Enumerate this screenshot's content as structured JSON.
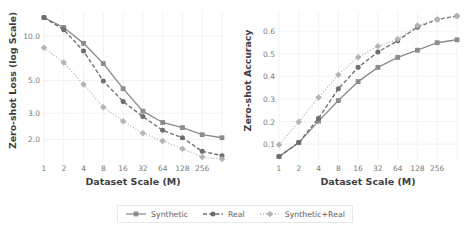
{
  "figure": {
    "xlabel": "Dataset Scale (M)",
    "legend": {
      "items": [
        {
          "label": "Synthetic",
          "color": "#8c8c8c",
          "dash": "solid",
          "marker": "square"
        },
        {
          "label": "Real",
          "color": "#6e6e6e",
          "dash": "dashed",
          "marker": "circle"
        },
        {
          "label": "Synthetic+Real",
          "color": "#b4b4b4",
          "dash": "dotted",
          "marker": "diamond"
        }
      ]
    }
  },
  "chart_data": [
    {
      "type": "line",
      "id": "zero-shot-loss",
      "title": "",
      "xlabel": "Dataset Scale (M)",
      "ylabel": "Zero-shot Loss (log Scale)",
      "yscale": "log",
      "xscale": "log",
      "grid": true,
      "legend_position": "below-figure",
      "x": [
        1,
        2,
        4,
        8,
        16,
        32,
        64,
        128,
        256,
        512
      ],
      "xtick_labels": [
        "1",
        "2",
        "4",
        "8",
        "16",
        "32",
        "64",
        "128",
        "256"
      ],
      "ytick_labels": [
        "10.0",
        "5.0",
        "3.0",
        "2.0"
      ],
      "ytick_values": [
        10.0,
        5.0,
        3.0,
        2.0
      ],
      "ylim": [
        1.45,
        14.5
      ],
      "series": [
        {
          "name": "Synthetic",
          "values": [
            13.3,
            11.4,
            8.9,
            6.5,
            4.4,
            3.1,
            2.6,
            2.4,
            2.15,
            2.05
          ]
        },
        {
          "name": "Real",
          "values": [
            13.3,
            11.0,
            7.9,
            4.95,
            3.6,
            2.85,
            2.3,
            2.05,
            1.66,
            1.55
          ]
        },
        {
          "name": "Synthetic+Real",
          "values": [
            8.3,
            6.6,
            4.7,
            3.3,
            2.65,
            2.2,
            1.95,
            1.73,
            1.52,
            1.47
          ]
        }
      ]
    },
    {
      "type": "line",
      "id": "zero-shot-accuracy",
      "title": "",
      "xlabel": "Dataset Scale (M)",
      "ylabel": "Zero-shot Accuracy",
      "yscale": "linear",
      "xscale": "log",
      "grid": true,
      "legend_position": "below-figure",
      "x": [
        1,
        2,
        4,
        8,
        16,
        32,
        64,
        128,
        256,
        512
      ],
      "xtick_labels": [
        "1",
        "2",
        "4",
        "8",
        "16",
        "32",
        "64",
        "128",
        "256"
      ],
      "ytick_labels": [
        "0.1",
        "0.2",
        "0.3",
        "0.4",
        "0.5",
        "0.6"
      ],
      "ytick_values": [
        0.1,
        0.2,
        0.3,
        0.4,
        0.5,
        0.6
      ],
      "ylim": [
        0.03,
        0.685
      ],
      "series": [
        {
          "name": "Synthetic",
          "values": [
            0.045,
            0.107,
            0.202,
            0.293,
            0.377,
            0.44,
            0.484,
            0.516,
            0.549,
            0.562
          ]
        },
        {
          "name": "Real",
          "values": [
            0.045,
            0.107,
            0.215,
            0.345,
            0.44,
            0.508,
            0.558,
            0.618,
            0.652,
            0.667
          ]
        },
        {
          "name": "Synthetic+Real",
          "values": [
            0.097,
            0.199,
            0.307,
            0.407,
            0.485,
            0.533,
            0.565,
            0.625,
            0.652,
            0.667
          ]
        }
      ]
    }
  ]
}
